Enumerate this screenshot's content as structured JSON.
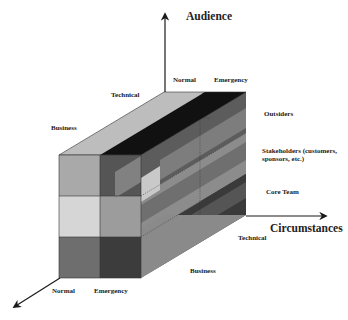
{
  "diagram": {
    "axes": {
      "vertical": {
        "title": "Audience",
        "levels": [
          "Core Team",
          "Stakeholders (customers, sponsors, etc.)",
          "Outsiders"
        ]
      },
      "horizontal": {
        "title": "Circumstances",
        "levels": [
          "Normal",
          "Emergency"
        ]
      },
      "depth": {
        "title": "",
        "levels": [
          "Business",
          "Technical"
        ]
      }
    },
    "labels": {
      "audience": "Audience",
      "circumstances": "Circumstances",
      "top_normal": "Normal",
      "top_emergency": "Emergency",
      "top_technical": "Technical",
      "top_business": "Business",
      "right_outsiders": "Outsiders",
      "right_stakeholders": "Stakeholders (customers, sponsors, etc.)",
      "right_core_team": "Core Team",
      "bottom_technical": "Technical",
      "bottom_business": "Business",
      "bottom_normal": "Normal",
      "bottom_emergency": "Emergency"
    },
    "colors": {
      "axis": "#1a1a1a",
      "top_face_light": "#bdbdbd",
      "top_face_dark": "#111111",
      "front_outsiders_normal": "#a9a9a9",
      "front_outsiders_emergency": "#555555",
      "front_stakeholders_normal": "#d6d6d6",
      "front_stakeholders_emergency": "#9c9c9c",
      "front_core_normal": "#6e6e6e",
      "front_core_emergency": "#3c3c3c"
    }
  }
}
